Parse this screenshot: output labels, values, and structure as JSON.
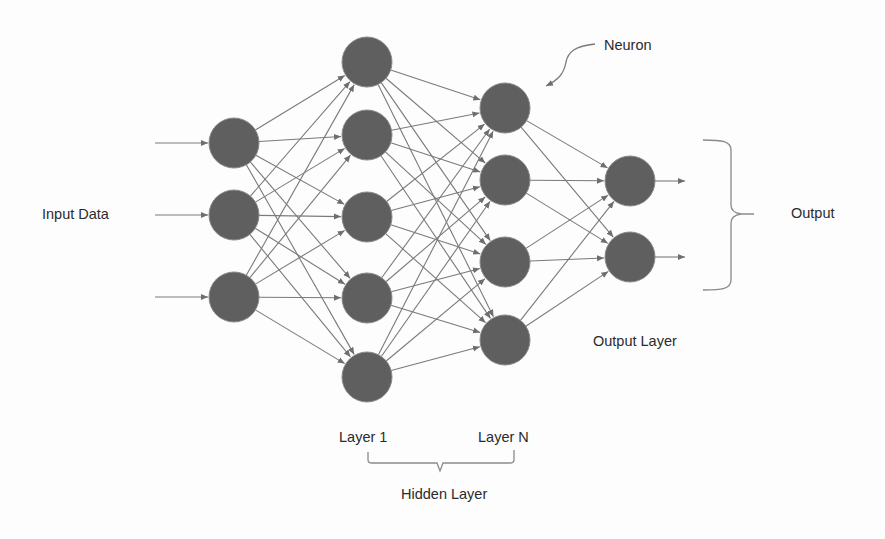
{
  "diagram": {
    "colors": {
      "neuron_fill": "#5f5f5f",
      "neuron_stroke": "#8a8a8a",
      "connection": "#7a7a7a",
      "text": "#2b2b2b",
      "background": "#fdfdfd"
    },
    "labels": {
      "input_data": "Input Data",
      "neuron": "Neuron",
      "output": "Output",
      "output_layer": "Output Layer",
      "layer_1": "Layer 1",
      "layer_n": "Layer N",
      "hidden_layer": "Hidden Layer"
    },
    "layers": [
      {
        "name": "input",
        "x": 234,
        "ys": [
          143,
          215,
          297
        ]
      },
      {
        "name": "hidden-1",
        "x": 367,
        "ys": [
          62,
          135,
          217,
          298,
          377
        ]
      },
      {
        "name": "hidden-n",
        "x": 505,
        "ys": [
          108,
          180,
          262,
          340
        ]
      },
      {
        "name": "output",
        "x": 630,
        "ys": [
          181,
          257
        ]
      }
    ],
    "neuron_radius": 25
  }
}
